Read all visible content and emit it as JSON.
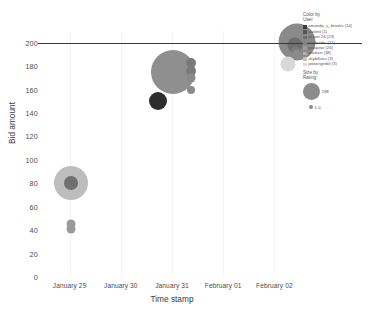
{
  "chart_data": {
    "type": "scatter",
    "title": "",
    "xlabel": "Time stamp",
    "ylabel": "Bid amount",
    "ylim": [
      0,
      210
    ],
    "yticks": [
      0,
      20,
      40,
      60,
      80,
      100,
      120,
      140,
      160,
      180,
      200
    ],
    "xticks": [
      "January 29",
      "January 30",
      "January 31",
      "February 01",
      "February 02"
    ],
    "grid": "vertical-light",
    "reference_line": {
      "axis": "y",
      "value": 200,
      "color": "#3a3a3a"
    },
    "points": [
      {
        "x": "January 29",
        "x_offset": 0.02,
        "y": 80,
        "size": 34,
        "color": "#bdbdbd",
        "user": "amanda_s_brooks"
      },
      {
        "x": "January 29",
        "x_offset": 0.02,
        "y": 80,
        "size": 14,
        "color": "#707070",
        "user": "oscott 24"
      },
      {
        "x": "January 29",
        "x_offset": 0.02,
        "y": 45,
        "size": 9,
        "color": "#9a9a9a",
        "user": "galrfam"
      },
      {
        "x": "January 29",
        "x_offset": 0.02,
        "y": 41,
        "size": 9,
        "color": "#9a9a9a",
        "user": "galrfam"
      },
      {
        "x": "January 30",
        "x_offset": 0.72,
        "y": 150,
        "size": 18,
        "color": "#2e2e2e",
        "user": "auilent"
      },
      {
        "x": "January 31",
        "x_offset": 0.02,
        "y": 175,
        "size": 44,
        "color": "#8f8f8f",
        "user": "oscott 24"
      },
      {
        "x": "January 31",
        "x_offset": 0.38,
        "y": 183,
        "size": 10,
        "color": "#7a7a7a",
        "user": "starken"
      },
      {
        "x": "January 31",
        "x_offset": 0.38,
        "y": 176,
        "size": 10,
        "color": "#7a7a7a",
        "user": "starken"
      },
      {
        "x": "January 31",
        "x_offset": 0.38,
        "y": 170,
        "size": 9,
        "color": "#8a8a8a",
        "user": "eagleizbc"
      },
      {
        "x": "January 31",
        "x_offset": 0.38,
        "y": 160,
        "size": 8,
        "color": "#8a8a8a",
        "user": "eagleizbc"
      },
      {
        "x": "February 02",
        "x_offset": 0.44,
        "y": 201,
        "size": 37,
        "color": "#8a8a8a",
        "user": "oscott 24"
      },
      {
        "x": "February 02",
        "x_offset": 0.4,
        "y": 198,
        "size": 15,
        "color": "#6e6e6e",
        "user": "amanda_s_brooks"
      },
      {
        "x": "February 02",
        "x_offset": 0.42,
        "y": 193,
        "size": 9,
        "color": "#7d7d7d",
        "user": "skybillues"
      },
      {
        "x": "February 02",
        "x_offset": 0.42,
        "y": 190,
        "size": 8,
        "color": "#8a8a8a",
        "user": "powergerbil"
      },
      {
        "x": "February 02",
        "x_offset": 0.26,
        "y": 182,
        "size": 15,
        "color": "#d8d8d8",
        "user": "powergerbil"
      }
    ]
  },
  "color_legend": {
    "title_line1": "Color by",
    "title_line2": "User",
    "items": [
      {
        "label": "amanda_s_brooks (14)",
        "color": "#3c3c3c"
      },
      {
        "label": "auilent (1)",
        "color": "#575757"
      },
      {
        "label": "oscott 24 (23)",
        "color": "#6e6e6e"
      },
      {
        "label": "eagleizbc (11)",
        "color": "#838383"
      },
      {
        "label": "golapow (26)",
        "color": "#9a9a9a"
      },
      {
        "label": "starken (38)",
        "color": "#aeaeae"
      },
      {
        "label": "skybillues (3)",
        "color": "#c4c4c4"
      },
      {
        "label": "powergerbil (3)",
        "color": "#dcdcdc"
      }
    ]
  },
  "size_legend": {
    "title_line1": "Size by",
    "title_line2": "Rating",
    "items": [
      {
        "label": "238",
        "diameter": 17
      },
      {
        "label": "1.0",
        "diameter": 4
      }
    ]
  }
}
